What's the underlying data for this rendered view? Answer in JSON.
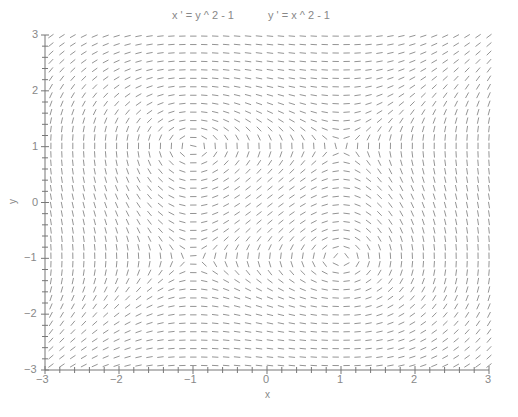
{
  "chart_data": {
    "type": "quiver",
    "title_parts": [
      "x ' = y ^ 2 - 1",
      "y ' = x ^ 2 - 1"
    ],
    "equations": {
      "dx_dt": "y^2 - 1",
      "dy_dt": "x^2 - 1"
    },
    "xlabel": "x",
    "ylabel": "y",
    "xlim": [
      -3,
      3
    ],
    "ylim": [
      -3,
      3
    ],
    "xticks": [
      -3,
      -2,
      -1,
      0,
      1,
      2,
      3
    ],
    "yticks": [
      -3,
      -2,
      -1,
      0,
      1,
      2,
      3
    ],
    "xtick_labels": [
      "−3",
      "−2",
      "−1",
      "0",
      "1",
      "2",
      "3"
    ],
    "ytick_labels": [
      "−3",
      "−2",
      "−1",
      "0",
      "1",
      "2",
      "3"
    ],
    "minor_tick_step": 0.2,
    "grid": {
      "cols": 41,
      "rows": 40
    },
    "segment_color": "#888888",
    "axis_color": "#777777",
    "grid_lines": false,
    "legend": null
  }
}
